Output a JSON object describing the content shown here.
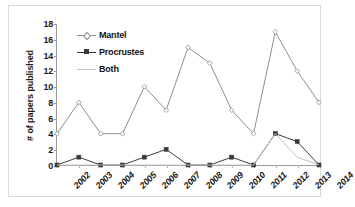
{
  "chart_data": {
    "type": "line",
    "title": "",
    "xlabel": "",
    "ylabel": "# of papers published",
    "categories": [
      "2002",
      "2003",
      "2004",
      "2005",
      "2006",
      "2007",
      "2008",
      "2009",
      "2010",
      "2011",
      "2012",
      "2013",
      "2014"
    ],
    "ylim": [
      0,
      18
    ],
    "yticks": [
      0,
      2,
      4,
      6,
      8,
      10,
      12,
      14,
      16,
      18
    ],
    "grid": false,
    "legend_position": "top-left",
    "series": [
      {
        "name": "Mantel",
        "color": "#8c8c8c",
        "marker": "diamond-open",
        "values": [
          4,
          8,
          4,
          4,
          10,
          7,
          15,
          13,
          7,
          4,
          17,
          12,
          8
        ]
      },
      {
        "name": "Procrustes",
        "color": "#3a3a3a",
        "marker": "square-filled",
        "values": [
          0,
          1,
          0,
          0,
          1,
          2,
          0,
          0,
          1,
          0,
          4,
          3,
          0
        ]
      },
      {
        "name": "Both",
        "color": "#c2c2c2",
        "marker": "none",
        "values": [
          0,
          0,
          0,
          0,
          0,
          0,
          0,
          0,
          0,
          0,
          4,
          1,
          0
        ]
      }
    ]
  },
  "axis": {
    "ytick_labels": [
      "0",
      "2",
      "4",
      "6",
      "8",
      "10",
      "12",
      "14",
      "16",
      "18"
    ]
  },
  "legend": {
    "items": [
      {
        "label": "Mantel"
      },
      {
        "label": "Procrustes"
      },
      {
        "label": "Both"
      }
    ]
  }
}
